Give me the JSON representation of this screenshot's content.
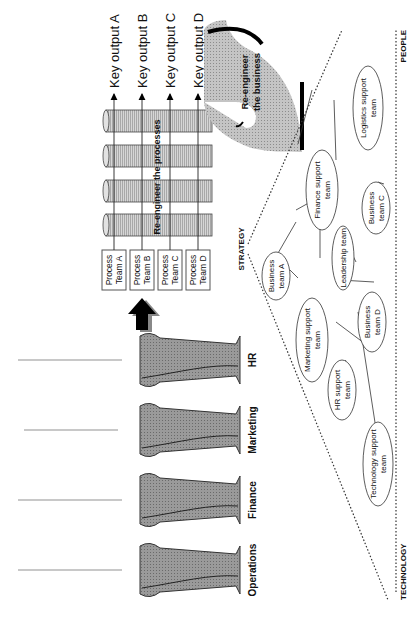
{
  "silos": {
    "labels": [
      "Operations",
      "Finance",
      "Marketing",
      "HR"
    ],
    "fill": "#8f8f8f"
  },
  "process_teams": [
    {
      "line1": "Process",
      "line2": "Team A"
    },
    {
      "line1": "Process",
      "line2": "Team B"
    },
    {
      "line1": "Process",
      "line2": "Team C"
    },
    {
      "line1": "Process",
      "line2": "Team D"
    }
  ],
  "key_outputs": [
    "Key output A",
    "Key output B",
    "Key output C",
    "Key output D"
  ],
  "reengineer_processes": "Re-engineer the processes",
  "reengineer_business": {
    "line1": "Re-engineer",
    "line2": "the business"
  },
  "triangle": {
    "apex": "STRATEGY",
    "left": "TECHNOLOGY",
    "right": "PEOPLE"
  },
  "teams": {
    "business_a": {
      "line1": "Business",
      "line2": "team A"
    },
    "marketing_support": {
      "line1": "Marketing support",
      "line2": "team"
    },
    "finance_support": {
      "line1": "Finance support",
      "line2": "team"
    },
    "leadership": {
      "line1": "Leadership team",
      "line2": ""
    },
    "hr_support": {
      "line1": "HR support",
      "line2": "team"
    },
    "business_d": {
      "line1": "Business",
      "line2": "team D"
    },
    "business_c": {
      "line1": "Business",
      "line2": "team C"
    },
    "technology_support": {
      "line1": "Technology support",
      "line2": "team"
    },
    "logistics_support": {
      "line1": "Logistics support",
      "line2": "team"
    }
  },
  "colors": {
    "silo": "#8f8f8f",
    "cylinder": "#c8c8c8",
    "business_shape": "#b4b4b4",
    "arrow": "#000000"
  }
}
